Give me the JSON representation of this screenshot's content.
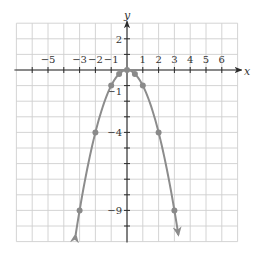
{
  "chart_data": {
    "type": "line",
    "title": "",
    "function": "y = -x^2",
    "xlabel": "x",
    "ylabel": "y",
    "xlim": [
      -7,
      7
    ],
    "ylim": [
      -11,
      3
    ],
    "grid": true,
    "x_tick_labels": [
      {
        "value": -5,
        "label": "−5"
      },
      {
        "value": -3,
        "label": "−3"
      },
      {
        "value": -2,
        "label": "−2"
      },
      {
        "value": -1,
        "label": "−1"
      },
      {
        "value": 1,
        "label": "1"
      },
      {
        "value": 2,
        "label": "2"
      },
      {
        "value": 3,
        "label": "3"
      },
      {
        "value": 4,
        "label": "4"
      },
      {
        "value": 5,
        "label": "5"
      },
      {
        "value": 6,
        "label": "6"
      }
    ],
    "y_tick_labels": [
      {
        "value": 2,
        "label": "2"
      },
      {
        "value": -1,
        "label": "−1"
      },
      {
        "value": -4,
        "label": "−4"
      },
      {
        "value": -9,
        "label": "−9"
      }
    ],
    "series": [
      {
        "name": "parabola",
        "color": "#8c8c8c",
        "points": [
          {
            "x": -3,
            "y": -9
          },
          {
            "x": -2,
            "y": -4
          },
          {
            "x": -1,
            "y": -1
          },
          {
            "x": -0.5,
            "y": -0.25
          },
          {
            "x": 0,
            "y": 0
          },
          {
            "x": 0.5,
            "y": -0.25
          },
          {
            "x": 1,
            "y": -1
          },
          {
            "x": 2,
            "y": -4
          },
          {
            "x": 3,
            "y": -9
          }
        ],
        "arrows_at_ends": true
      }
    ],
    "legend": null
  },
  "colors": {
    "grid": "#cfcfcf",
    "axis": "#2a2a2a",
    "curve": "#8c8c8c",
    "text": "#333333"
  }
}
